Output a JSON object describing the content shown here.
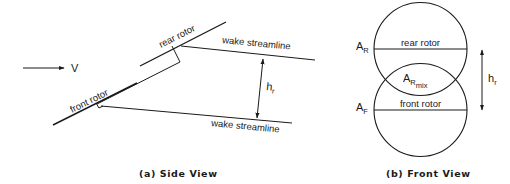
{
  "side_view": {
    "caption": "(a)  Side View",
    "velocity_label": "V",
    "front_rotor_label": "front rotor",
    "rear_rotor_label": "rear rotor",
    "upper_wake_label": "wake streamline",
    "lower_wake_label": "wake streamline",
    "separation_label": "h",
    "separation_subscript": "r"
  },
  "front_view": {
    "caption": "(b)  Front View",
    "rear_rotor_label": "rear rotor",
    "front_rotor_label": "front rotor",
    "rear_area_label": "A",
    "rear_area_subscript": "R",
    "front_area_label": "A",
    "front_area_subscript": "F",
    "mix_area_label": "A",
    "mix_area_subscript": "R",
    "mix_area_subsubscript": "mix",
    "separation_label": "h",
    "separation_subscript": "r"
  },
  "colors": {
    "ink": "#1a1a1a",
    "background": "#ffffff"
  }
}
